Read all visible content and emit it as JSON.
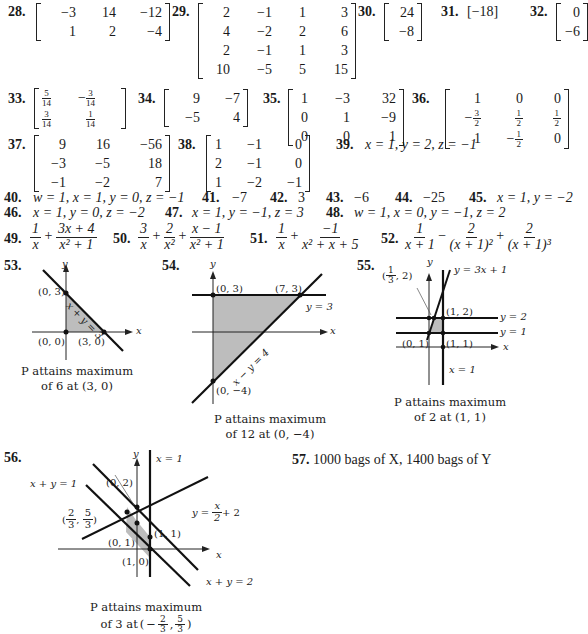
{
  "problems": {
    "p28": {
      "num": "28.",
      "rows": [
        [
          "−3",
          "14",
          "−12"
        ],
        [
          "1",
          "2",
          "−4"
        ]
      ]
    },
    "p29": {
      "num": "29.",
      "rows": [
        [
          "2",
          "−1",
          "1",
          "3"
        ],
        [
          "4",
          "−2",
          "2",
          "6"
        ],
        [
          "2",
          "−1",
          "1",
          "3"
        ],
        [
          "10",
          "−5",
          "5",
          "15"
        ]
      ]
    },
    "p30": {
      "num": "30.",
      "rows": [
        [
          "24"
        ],
        [
          "−8"
        ]
      ]
    },
    "p31": {
      "num": "31.",
      "value": "[−18]"
    },
    "p32": {
      "num": "32.",
      "rows": [
        [
          "0"
        ],
        [
          "−6"
        ]
      ]
    },
    "p33": {
      "num": "33.",
      "rows": [
        [
          {
            "n": "5",
            "d": "14"
          },
          {
            "neg": true,
            "n": "3",
            "d": "14"
          }
        ],
        [
          {
            "n": "3",
            "d": "14"
          },
          {
            "n": "1",
            "d": "14"
          }
        ]
      ]
    },
    "p34": {
      "num": "34.",
      "rows": [
        [
          "9",
          "−7"
        ],
        [
          "−5",
          "4"
        ]
      ]
    },
    "p35": {
      "num": "35.",
      "rows": [
        [
          "1",
          "−3",
          "32"
        ],
        [
          "0",
          "1",
          "−9"
        ],
        [
          "0",
          "0",
          "1"
        ]
      ]
    },
    "p36": {
      "num": "36.",
      "rows": [
        [
          "1",
          "0",
          "0"
        ],
        [
          "−3/2",
          "1/2",
          "1/2"
        ],
        [
          "1",
          "−1/2",
          "0"
        ]
      ]
    },
    "p37": {
      "num": "37.",
      "rows": [
        [
          "9",
          "16",
          "−56"
        ],
        [
          "−3",
          "−5",
          "18"
        ],
        [
          "−1",
          "−2",
          "7"
        ]
      ]
    },
    "p38": {
      "num": "38.",
      "rows": [
        [
          "1",
          "−1",
          "0"
        ],
        [
          "2",
          "−1",
          "0"
        ],
        [
          "1",
          "−2",
          "−1"
        ]
      ]
    },
    "p39": {
      "num": "39.",
      "text": "x = 1, y = 2, z = −1"
    },
    "p40": {
      "num": "40.",
      "text": "w = 1, x = 1, y = 0, z = −1"
    },
    "p41": {
      "num": "41.",
      "text": "−7"
    },
    "p42": {
      "num": "42.",
      "text": "3"
    },
    "p43": {
      "num": "43.",
      "text": "−6"
    },
    "p44": {
      "num": "44.",
      "text": "−25"
    },
    "p45": {
      "num": "45.",
      "text": "x = 1, y = −2"
    },
    "p46": {
      "num": "46.",
      "text": "x = 1, y = 0, z = −2"
    },
    "p47": {
      "num": "47.",
      "text": "x = 1, y = −1, z = 3"
    },
    "p48": {
      "num": "48.",
      "text": "w = 1, x = 0, y = −1, z = 2"
    },
    "p49": {
      "num": "49.",
      "terms": [
        {
          "n": "1",
          "d": "x"
        },
        {
          "op": "+",
          "n": "3x + 4",
          "d": "x² + 1"
        }
      ]
    },
    "p50": {
      "num": "50.",
      "terms": [
        {
          "n": "3",
          "d": "x"
        },
        {
          "op": "+",
          "n": "2",
          "d": "x²"
        },
        {
          "op": "+",
          "n": "x − 1",
          "d": "x² + 1"
        }
      ]
    },
    "p51": {
      "num": "51.",
      "terms": [
        {
          "n": "1",
          "d": "x"
        },
        {
          "op": "+",
          "n": "−1",
          "d": "x² + x + 5"
        }
      ]
    },
    "p52": {
      "num": "52.",
      "terms": [
        {
          "n": "1",
          "d": "x + 1"
        },
        {
          "op": "−",
          "n": "2",
          "d": "(x + 1)²"
        },
        {
          "op": "+",
          "n": "2",
          "d": "(x + 1)³"
        }
      ]
    },
    "p53": {
      "num": "53.",
      "labels": {
        "y": "y",
        "x": "x",
        "line": "x + y = 3",
        "p1": "(0, 3)",
        "p2": "(0, 0)",
        "p3": "(3, 0)"
      },
      "caption": [
        "P attains maximum",
        "of 6 at (3, 0)"
      ]
    },
    "p54": {
      "num": "54.",
      "labels": {
        "y": "y",
        "x": "x",
        "p1": "(0, 3)",
        "p2": "(7, 3)",
        "l1": "y = 3",
        "l2": "x − y = 4",
        "p3": "(0, −4)"
      },
      "caption": [
        "P attains maximum",
        "of 12 at (0, −4)"
      ]
    },
    "p55": {
      "num": "55.",
      "labels": {
        "y": "y",
        "x": "x",
        "l1": "y = 3x + 1",
        "p1n": "1",
        "p1d": "3",
        "p1y": ", 2",
        "p2": "(1, 2)",
        "l2": "y = 2",
        "l3": "y = 1",
        "p3": "(0, 1)",
        "p4": "(1, 1)",
        "l4": "x = 1"
      },
      "caption": [
        "P attains maximum",
        "of 2 at (1, 1)"
      ]
    },
    "p56": {
      "num": "56.",
      "labels": {
        "y": "y",
        "x": "x",
        "l1": "x = 1",
        "l2": "x + y = 1",
        "p1": "(0, 2)",
        "l3a": "y = ",
        "l3n": "x",
        "l3d": "2",
        "l3b": " + 2",
        "p2": "(1, 1)",
        "p3": "(0, 1)",
        "p4": "(1, 0)",
        "l4": "x + y = 2",
        "fa": "2",
        "fb": "3",
        "fc": "5",
        "fd": "3"
      },
      "caption": [
        "P attains maximum",
        "of 3 at"
      ],
      "caption_point": {
        "neg": "−",
        "an": "2",
        "ad": "3",
        "bn": "5",
        "bd": "3"
      }
    },
    "p57": {
      "num": "57.",
      "text": "1000 bags of X, 1400 bags of Y"
    }
  }
}
